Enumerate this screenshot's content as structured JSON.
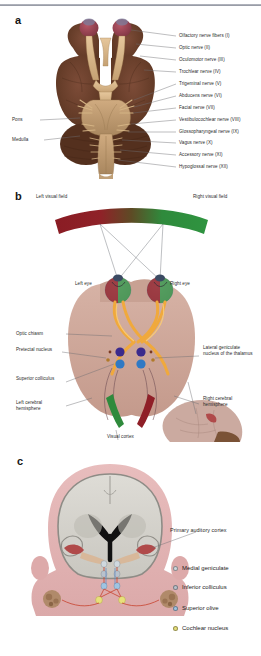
{
  "figure": {
    "panels": [
      "a",
      "b",
      "c"
    ]
  },
  "panel_a": {
    "letter": "a",
    "view": "ventral-brain-view",
    "left_labels": [
      {
        "text": "Pons",
        "target": "pons"
      },
      {
        "text": "Medulla",
        "target": "medulla"
      }
    ],
    "right_labels": [
      {
        "text": "Olfactory nerve fibers (I)",
        "nerve": "I"
      },
      {
        "text": "Optic nerve (II)",
        "nerve": "II"
      },
      {
        "text": "Oculomotor nerve (III)",
        "nerve": "III"
      },
      {
        "text": "Trochlear nerve (IV)",
        "nerve": "IV"
      },
      {
        "text": "Trigeminal nerve (V)",
        "nerve": "V"
      },
      {
        "text": "Abducens nerve (VI)",
        "nerve": "VI"
      },
      {
        "text": "Facial nerve (VII)",
        "nerve": "VII"
      },
      {
        "text": "Vestibulocochlear nerve (VIII)",
        "nerve": "VIII"
      },
      {
        "text": "Glossopharyngeal nerve (IX)",
        "nerve": "IX"
      },
      {
        "text": "Vagus nerve (X)",
        "nerve": "X"
      },
      {
        "text": "Accessory nerve (XI)",
        "nerve": "XI"
      },
      {
        "text": "Hypoglossal nerve (XII)",
        "nerve": "XII"
      }
    ],
    "colors": {
      "cortex": "#6b4030",
      "cortex_dark": "#53301f",
      "olfactory_bulb": "#9e4555",
      "nerve": "#d9b88c",
      "pons": "#c2a078"
    }
  },
  "panel_b": {
    "letter": "b",
    "view": "visual-pathway",
    "field_left": "Left visual field",
    "field_right": "Right visual field",
    "eye_left": "Left eye",
    "eye_right": "Right eye",
    "labels_left": [
      "Optic chiasm",
      "Pretectal nucleus",
      "Superior colliculus",
      "Left cerebral hemisphere"
    ],
    "labels_right": [
      "Lateral geniculate nucleus of the thalamus",
      "Right cerebral hemisphere"
    ],
    "label_bottom": "Visual cortex",
    "colors": {
      "field_left": "#8f1f27",
      "field_right": "#2f8a3c",
      "brain": "#cfa99c",
      "optic_tract": "#f0a93c",
      "pretectal": "#3b2a8c",
      "colliculus": "#2f79c4",
      "cortex_left": "#2f8a3c",
      "cortex_right": "#8f1f27"
    }
  },
  "panel_c": {
    "letter": "c",
    "view": "auditory-pathway",
    "label_cortex": "Primary auditory cortex",
    "legend": [
      {
        "label": "Medial geniculate",
        "color": "#cfd8de"
      },
      {
        "label": "Inferior colliculus",
        "color": "#b9c2cc"
      },
      {
        "label": "Superior olive",
        "color": "#9fc4e2"
      },
      {
        "label": "Cochlear nucleus",
        "color": "#e8e07a"
      }
    ],
    "colors": {
      "skin": "#e3b4b4",
      "brain": "#d4d2cc",
      "ventricle": "#111111",
      "auditory_cortex": "#b04a4a",
      "nerve": "#c8432f"
    }
  }
}
